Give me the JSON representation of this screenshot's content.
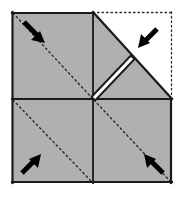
{
  "diagram": {
    "title": "Paper folding step diagram",
    "type": "origami-fold-step",
    "caption": "",
    "colors": {
      "paper_shaded": "#b0b0b0",
      "paper_unshaded": "#ffffff",
      "outline": "#1a1a1a",
      "fold_dotted": "#2b2b2b",
      "arrow": "#000000",
      "background": "#ffffff",
      "gap_white": "#ffffff"
    },
    "square": {
      "label": "original-square-outline",
      "left": 12,
      "top": 12,
      "right": 172,
      "bottom": 183,
      "center_x": 93,
      "center_y": 99
    },
    "quadrants": [
      {
        "name": "upper-left",
        "shaded": true,
        "fold_diagonal": "top-left-to-bottom-right"
      },
      {
        "name": "upper-right",
        "shaded": false,
        "fold_diagonal": "none"
      },
      {
        "name": "lower-left",
        "shaded": true,
        "fold_diagonal": "top-left-to-bottom-right"
      },
      {
        "name": "lower-right",
        "shaded": true,
        "fold_diagonal": "top-left-to-bottom-right"
      }
    ],
    "flap": {
      "name": "folded-flap-upper-right",
      "description": "Upper-right quadrant folded over revealing white paper beneath",
      "shaded": true,
      "gap_line": "double-line-white-gap"
    },
    "dotted_outline": {
      "name": "original-position-outline",
      "description": "Dotted outline of the unfolded upper-right corner"
    },
    "arrows": [
      {
        "name": "arrow-upper-left",
        "direction": "down-right",
        "points_to": "center"
      },
      {
        "name": "arrow-upper-right",
        "direction": "down-left",
        "points_to": "center"
      },
      {
        "name": "arrow-lower-left",
        "direction": "up-right",
        "points_to": "center"
      },
      {
        "name": "arrow-lower-right",
        "direction": "up-left",
        "points_to": "center"
      }
    ]
  }
}
